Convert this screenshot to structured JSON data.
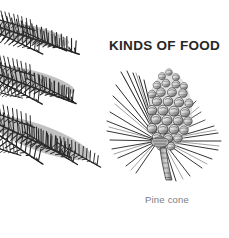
{
  "page": {
    "background_color": "#ffffff",
    "width": 229,
    "height": 238
  },
  "heading": {
    "text": "KINDS OF FOOD",
    "color": "#262626"
  },
  "figure": {
    "caption": "Pine cone",
    "caption_color": "#7d7d7d",
    "illustration_name": "pine-cone-engraving",
    "ink_color": "#1f1f1f"
  },
  "decoration": {
    "name": "conifer-branches",
    "count": 3,
    "color": "#2a2a2a",
    "branches": [
      {
        "label": "upper-branch"
      },
      {
        "label": "middle-branch"
      },
      {
        "label": "lower-branch"
      }
    ]
  }
}
